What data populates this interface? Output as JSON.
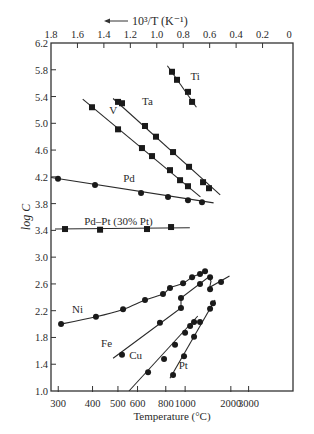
{
  "chart_data": {
    "type": "scatter",
    "title": "",
    "xlabel": "Temperature (°C)",
    "x2label": "10³/T (K⁻¹)",
    "x2label_arrow": "←",
    "ylabel": "log C",
    "xlim": [
      1.8,
      0
    ],
    "ylim": [
      1.0,
      6.2
    ],
    "x_axis_variable": "10^3/T (K^-1)",
    "yticks": [
      1.0,
      1.4,
      1.8,
      2.2,
      2.6,
      3.0,
      3.4,
      3.8,
      4.2,
      4.6,
      5.0,
      5.4,
      5.8,
      6.2
    ],
    "ytick_labels": [
      "1.0",
      "1.4",
      "1.8",
      "2.2",
      "2.6",
      "3.0",
      "3.4",
      "3.8",
      "4.2",
      "4.6",
      "5.0",
      "5.4",
      "5.8",
      "6.2"
    ],
    "top_ticks": [
      1.8,
      1.6,
      1.4,
      1.2,
      1.0,
      0.8,
      0.6,
      0.4,
      0.2,
      0
    ],
    "top_tick_labels": [
      "1.8",
      "1.6",
      "1.4",
      "1.2",
      "1.0",
      "0.8",
      "0.6",
      "0.4",
      "0.2",
      "0"
    ],
    "bottom_ticks_celsius": [
      300,
      400,
      500,
      600,
      800,
      1000,
      2000,
      3000
    ],
    "bottom_tick_labels": [
      "300",
      "400",
      "500",
      "600",
      "800",
      "1000",
      "2000",
      "3000"
    ],
    "grid": false,
    "legend": "none (inline labels)",
    "series": [
      {
        "name": "Ti",
        "marker": "square",
        "label_pos": [
          0.71,
          5.65
        ],
        "line": [
          [
            0.92,
            5.86
          ],
          [
            0.7,
            5.24
          ]
        ],
        "x": [
          0.885,
          0.847,
          0.764,
          0.733
        ],
        "y": [
          5.77,
          5.65,
          5.47,
          5.32
        ]
      },
      {
        "name": "Ta",
        "marker": "square",
        "label_pos": [
          1.07,
          5.28
        ],
        "line": [
          [
            1.33,
            5.37
          ],
          [
            0.52,
            3.93
          ]
        ],
        "x": [
          1.293,
          1.263,
          1.089,
          1.006,
          0.877,
          0.756,
          0.65,
          0.605
        ],
        "y": [
          5.32,
          5.3,
          4.96,
          4.8,
          4.57,
          4.35,
          4.12,
          4.03
        ]
      },
      {
        "name": "V",
        "marker": "square",
        "label_pos": [
          1.33,
          5.14
        ],
        "line": [
          [
            1.56,
            5.36
          ],
          [
            0.67,
            3.9
          ]
        ],
        "x": [
          1.49,
          1.293,
          1.112,
          1.036,
          0.9,
          0.824,
          0.764
        ],
        "y": [
          5.24,
          4.91,
          4.63,
          4.51,
          4.3,
          4.15,
          4.06
        ]
      },
      {
        "name": "Pd",
        "marker": "circle",
        "label_pos": [
          1.21,
          4.12
        ],
        "line": [
          [
            1.8,
            4.19
          ],
          [
            0.57,
            3.81
          ]
        ],
        "x": [
          1.747,
          1.467,
          1.119,
          0.915,
          0.764,
          0.658
        ],
        "y": [
          4.17,
          4.08,
          3.96,
          3.9,
          3.85,
          3.82
        ]
      },
      {
        "name": "Pd–Pt (30% Pt)",
        "marker": "square",
        "label_pos": [
          1.29,
          3.48
        ],
        "line": [
          [
            1.77,
            3.42
          ],
          [
            0.75,
            3.44
          ]
        ],
        "x": [
          1.694,
          1.429,
          1.074,
          0.892
        ],
        "y": [
          3.42,
          3.41,
          3.42,
          3.45
        ]
      },
      {
        "name": "Ni",
        "marker": "circle",
        "label_pos": [
          1.6,
          2.17
        ],
        "x": [
          1.724,
          1.46,
          1.255,
          1.089,
          0.953,
          0.9,
          0.801,
          0.733,
          0.673,
          0.635
        ],
        "y": [
          2.0,
          2.11,
          2.22,
          2.36,
          2.45,
          2.54,
          2.61,
          2.7,
          2.75,
          2.79
        ]
      },
      {
        "name": "Fe",
        "marker": "circle",
        "label_pos": [
          1.38,
          1.66
        ],
        "line": [
          [
            1.33,
            1.49
          ],
          [
            0.817,
            2.24
          ],
          [
            0.817,
            2.39
          ],
          [
            0.61,
            2.7
          ],
          [
            0.59,
            2.64
          ],
          [
            0.6,
            2.55
          ],
          [
            0.45,
            2.72
          ]
        ],
        "x": [
          1.263,
          0.976,
          0.817,
          0.817,
          0.673,
          0.597,
          0.597,
          0.514
        ],
        "y": [
          1.54,
          2.02,
          2.24,
          2.39,
          2.6,
          2.7,
          2.52,
          2.63
        ]
      },
      {
        "name": "Cu",
        "marker": "circle",
        "label_pos": [
          1.16,
          1.48
        ],
        "line": [
          [
            1.21,
            1.0
          ],
          [
            0.69,
            2.12
          ]
        ],
        "x": [
          1.066,
          0.945,
          0.862,
          0.786,
          0.748,
          0.718
        ],
        "y": [
          1.28,
          1.48,
          1.69,
          1.87,
          1.97,
          2.03
        ]
      },
      {
        "name": "Pt",
        "marker": "circle",
        "label_pos": [
          0.8,
          1.33
        ],
        "line": [
          [
            0.9,
            1.19
          ],
          [
            0.56,
            2.36
          ]
        ],
        "x": [
          0.877,
          0.794,
          0.718,
          0.673,
          0.597,
          0.575
        ],
        "y": [
          1.24,
          1.52,
          1.81,
          2.03,
          2.23,
          2.31
        ]
      }
    ]
  },
  "axes": {
    "top_label": "10³/T (K⁻¹)",
    "bottom_label": "Temperature (°C)",
    "left_label": "log C"
  }
}
